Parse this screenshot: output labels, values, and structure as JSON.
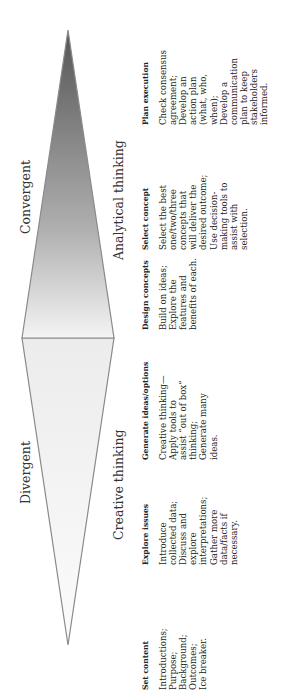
{
  "labels": {
    "divergent": "Divergent",
    "convergent": "Convergent",
    "creative": "Creative thinking",
    "analytical": "Analytical thinking"
  },
  "colors": {
    "outline": "#8a8a8a",
    "divergent_fill_light": "#fbfbfb",
    "divergent_fill_mid": "#e8e8e8",
    "convergent_fill_light": "#f2f2f2",
    "convergent_fill_dark": "#5e5e5e"
  },
  "columns": [
    {
      "header": "Set content",
      "lines": [
        "Introductions;",
        "Purpose;",
        "Background;",
        "Outcomes;",
        "Ice breaker."
      ]
    },
    {
      "header": "Explore issues",
      "lines": [
        "Introduce",
        "collected data;",
        "Discuss and",
        "explore",
        "interpretations;",
        "Gather more",
        "data/facts if",
        "necessary."
      ]
    },
    {
      "header": "Generate ideas/options",
      "lines": [
        "Creative thinking—",
        "Apply tools to",
        "assist “out of box”",
        "thinking;",
        "Generate many",
        "ideas."
      ]
    },
    {
      "header": "Design concepts",
      "lines": [
        "Build on ideas;",
        "Explore the",
        "features and",
        "benefits of each."
      ]
    },
    {
      "header": "Select concept",
      "lines": [
        "Select the best",
        "one/two/three",
        "concepts that",
        "will deliver the",
        "desired outcome;",
        "Use decision-",
        "making tools to",
        "assist with",
        "selection."
      ]
    },
    {
      "header": "Plan execution",
      "lines": [
        "Check consensus",
        "agreement;",
        "Develop an",
        "action plan",
        "(what, who,",
        "when);",
        "Develop a",
        "communication",
        "plan to keep",
        "stakeholders",
        "informed."
      ]
    }
  ]
}
